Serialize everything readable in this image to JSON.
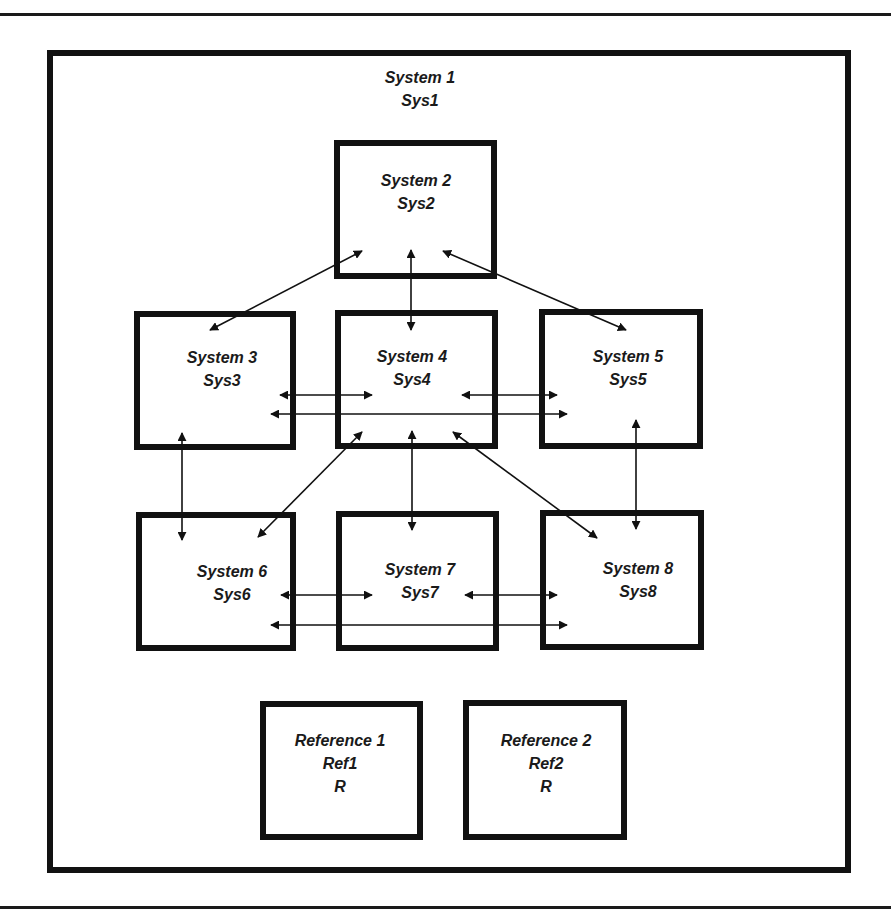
{
  "colors": {
    "ink": "#111111",
    "background": "#ffffff"
  },
  "rules": [
    {
      "name": "top-rule",
      "y": 13
    },
    {
      "name": "bottom-rule",
      "y": 906
    }
  ],
  "container": {
    "name": "system-1-container",
    "x": 50,
    "y": 53,
    "w": 798,
    "h": 817,
    "stroke": 6,
    "title": "System 1",
    "subtitle": "Sys1",
    "title_x": 420,
    "title_y": 83,
    "subtitle_y": 106
  },
  "nodes": [
    {
      "id": "sys2",
      "title": "System 2",
      "short": "Sys2",
      "x": 337,
      "y": 143,
      "w": 157,
      "h": 133,
      "tx": 416,
      "ty": 186
    },
    {
      "id": "sys3",
      "title": "System 3",
      "short": "Sys3",
      "x": 137,
      "y": 314,
      "w": 156,
      "h": 133,
      "tx": 222,
      "ty": 363
    },
    {
      "id": "sys4",
      "title": "System 4",
      "short": "Sys4",
      "x": 338,
      "y": 313,
      "w": 157,
      "h": 133,
      "tx": 412,
      "ty": 362
    },
    {
      "id": "sys5",
      "title": "System 5",
      "short": "Sys5",
      "x": 542,
      "y": 312,
      "w": 158,
      "h": 134,
      "tx": 628,
      "ty": 362
    },
    {
      "id": "sys6",
      "title": "System 6",
      "short": "Sys6",
      "x": 139,
      "y": 515,
      "w": 154,
      "h": 133,
      "tx": 232,
      "ty": 577
    },
    {
      "id": "sys7",
      "title": "System 7",
      "short": "Sys7",
      "x": 339,
      "y": 514,
      "w": 157,
      "h": 134,
      "tx": 420,
      "ty": 575
    },
    {
      "id": "sys8",
      "title": "System 8",
      "short": "Sys8",
      "x": 543,
      "y": 513,
      "w": 158,
      "h": 134,
      "tx": 638,
      "ty": 574
    }
  ],
  "references": [
    {
      "id": "ref1",
      "title": "Reference 1",
      "short": "Ref1",
      "tag": "R",
      "x": 263,
      "y": 704,
      "w": 157,
      "h": 133,
      "tx": 340,
      "ty": 746
    },
    {
      "id": "ref2",
      "title": "Reference 2",
      "short": "Ref2",
      "tag": "R",
      "x": 466,
      "y": 703,
      "w": 158,
      "h": 134,
      "tx": 546,
      "ty": 746
    }
  ],
  "connections": [
    {
      "from": "sys2",
      "to": "sys3",
      "x1": 362,
      "y1": 251,
      "x2": 210,
      "y2": 330
    },
    {
      "from": "sys2",
      "to": "sys4",
      "x1": 411,
      "y1": 250,
      "x2": 411,
      "y2": 330
    },
    {
      "from": "sys2",
      "to": "sys5",
      "x1": 443,
      "y1": 251,
      "x2": 626,
      "y2": 330
    },
    {
      "from": "sys3",
      "to": "sys4",
      "x1": 280,
      "y1": 395,
      "x2": 372,
      "y2": 395
    },
    {
      "from": "sys4",
      "to": "sys5",
      "x1": 462,
      "y1": 395,
      "x2": 557,
      "y2": 395
    },
    {
      "from": "sys3",
      "to": "sys5",
      "x1": 271,
      "y1": 414,
      "x2": 567,
      "y2": 414
    },
    {
      "from": "sys3",
      "to": "sys6",
      "x1": 182,
      "y1": 433,
      "x2": 182,
      "y2": 540
    },
    {
      "from": "sys4",
      "to": "sys6",
      "x1": 362,
      "y1": 432,
      "x2": 258,
      "y2": 537
    },
    {
      "from": "sys4",
      "to": "sys7",
      "x1": 412,
      "y1": 431,
      "x2": 412,
      "y2": 530
    },
    {
      "from": "sys4",
      "to": "sys8",
      "x1": 453,
      "y1": 432,
      "x2": 597,
      "y2": 538
    },
    {
      "from": "sys5",
      "to": "sys8",
      "x1": 636,
      "y1": 420,
      "x2": 636,
      "y2": 529
    },
    {
      "from": "sys6",
      "to": "sys7",
      "x1": 281,
      "y1": 595,
      "x2": 372,
      "y2": 595
    },
    {
      "from": "sys7",
      "to": "sys8",
      "x1": 465,
      "y1": 595,
      "x2": 557,
      "y2": 595
    },
    {
      "from": "sys6",
      "to": "sys8",
      "x1": 271,
      "y1": 625,
      "x2": 567,
      "y2": 625
    }
  ]
}
